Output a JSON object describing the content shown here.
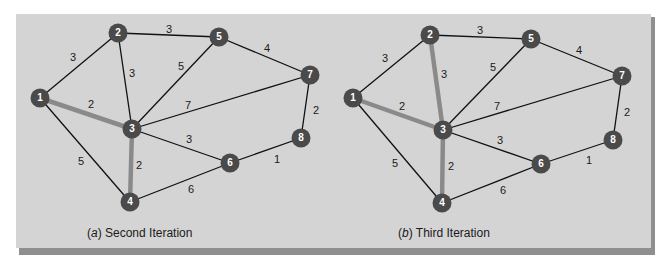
{
  "figure": {
    "panel_color": "#d4d4d4",
    "node_color": "#4a4a4a",
    "edge_color": "#111111",
    "highlight_color": "#8a8a8a",
    "label_color": "#1a1a1a"
  },
  "graphs": [
    {
      "id": "a",
      "caption_letter": "a",
      "caption_text": " Second Iteration",
      "caption_pos": [
        87,
        238
      ],
      "nodes": [
        {
          "id": "1",
          "x": 40,
          "y": 98
        },
        {
          "id": "2",
          "x": 118,
          "y": 33
        },
        {
          "id": "3",
          "x": 132,
          "y": 129
        },
        {
          "id": "4",
          "x": 130,
          "y": 202
        },
        {
          "id": "5",
          "x": 219,
          "y": 37
        },
        {
          "id": "6",
          "x": 230,
          "y": 163
        },
        {
          "id": "7",
          "x": 310,
          "y": 75
        },
        {
          "id": "8",
          "x": 301,
          "y": 138
        }
      ],
      "edges": [
        {
          "from": "1",
          "to": "2",
          "weight": "3",
          "lx": 73,
          "ly": 58,
          "highlight": false
        },
        {
          "from": "1",
          "to": "3",
          "weight": "2",
          "lx": 91,
          "ly": 105,
          "highlight": true
        },
        {
          "from": "1",
          "to": "4",
          "weight": "5",
          "lx": 81,
          "ly": 162,
          "highlight": false
        },
        {
          "from": "2",
          "to": "3",
          "weight": "3",
          "lx": 132,
          "ly": 74,
          "highlight": false
        },
        {
          "from": "2",
          "to": "5",
          "weight": "3",
          "lx": 169,
          "ly": 30,
          "highlight": false
        },
        {
          "from": "3",
          "to": "4",
          "weight": "2",
          "lx": 139,
          "ly": 166,
          "highlight": true
        },
        {
          "from": "3",
          "to": "5",
          "weight": "5",
          "lx": 181,
          "ly": 67,
          "highlight": false
        },
        {
          "from": "3",
          "to": "6",
          "weight": "3",
          "lx": 189,
          "ly": 140,
          "highlight": false
        },
        {
          "from": "3",
          "to": "7",
          "weight": "7",
          "lx": 188,
          "ly": 106,
          "highlight": false
        },
        {
          "from": "4",
          "to": "6",
          "weight": "6",
          "lx": 191,
          "ly": 190,
          "highlight": false
        },
        {
          "from": "5",
          "to": "7",
          "weight": "4",
          "lx": 267,
          "ly": 49,
          "highlight": false
        },
        {
          "from": "6",
          "to": "8",
          "weight": "1",
          "lx": 277,
          "ly": 160,
          "highlight": false
        },
        {
          "from": "7",
          "to": "8",
          "weight": "2",
          "lx": 316,
          "ly": 111,
          "highlight": false
        }
      ]
    },
    {
      "id": "b",
      "caption_letter": "b",
      "caption_text": " Third Iteration",
      "caption_pos": [
        398,
        238
      ],
      "nodes": [
        {
          "id": "1",
          "x": 353,
          "y": 98
        },
        {
          "id": "2",
          "x": 430,
          "y": 35
        },
        {
          "id": "3",
          "x": 443,
          "y": 130
        },
        {
          "id": "4",
          "x": 442,
          "y": 203
        },
        {
          "id": "5",
          "x": 531,
          "y": 39
        },
        {
          "id": "6",
          "x": 541,
          "y": 164
        },
        {
          "id": "7",
          "x": 622,
          "y": 76
        },
        {
          "id": "8",
          "x": 613,
          "y": 140
        }
      ],
      "edges": [
        {
          "from": "1",
          "to": "2",
          "weight": "3",
          "lx": 385,
          "ly": 59,
          "highlight": false
        },
        {
          "from": "1",
          "to": "3",
          "weight": "2",
          "lx": 402,
          "ly": 107,
          "highlight": true
        },
        {
          "from": "1",
          "to": "4",
          "weight": "5",
          "lx": 395,
          "ly": 164,
          "highlight": false
        },
        {
          "from": "2",
          "to": "3",
          "weight": "3",
          "lx": 444,
          "ly": 75,
          "highlight": true
        },
        {
          "from": "2",
          "to": "5",
          "weight": "3",
          "lx": 480,
          "ly": 31,
          "highlight": false
        },
        {
          "from": "3",
          "to": "4",
          "weight": "2",
          "lx": 451,
          "ly": 167,
          "highlight": true
        },
        {
          "from": "3",
          "to": "5",
          "weight": "5",
          "lx": 493,
          "ly": 68,
          "highlight": false
        },
        {
          "from": "3",
          "to": "6",
          "weight": "3",
          "lx": 500,
          "ly": 141,
          "highlight": false
        },
        {
          "from": "3",
          "to": "7",
          "weight": "7",
          "lx": 497,
          "ly": 107,
          "highlight": false
        },
        {
          "from": "4",
          "to": "6",
          "weight": "6",
          "lx": 503,
          "ly": 191,
          "highlight": false
        },
        {
          "from": "5",
          "to": "7",
          "weight": "4",
          "lx": 579,
          "ly": 51,
          "highlight": false
        },
        {
          "from": "6",
          "to": "8",
          "weight": "1",
          "lx": 589,
          "ly": 161,
          "highlight": false
        },
        {
          "from": "7",
          "to": "8",
          "weight": "2",
          "lx": 627,
          "ly": 113,
          "highlight": false
        }
      ]
    }
  ]
}
